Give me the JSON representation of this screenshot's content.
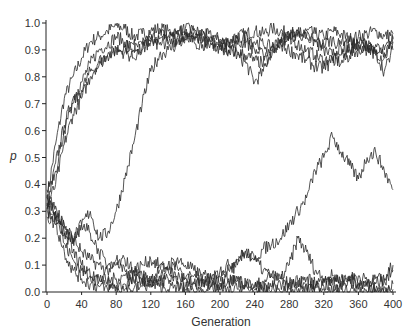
{
  "chart_data": {
    "type": "line",
    "title": "",
    "xlabel": "Generation",
    "ylabel": "p",
    "xlim": [
      0,
      400
    ],
    "ylim": [
      0.0,
      1.0
    ],
    "xticks": [
      0,
      40,
      80,
      120,
      160,
      200,
      240,
      280,
      320,
      360,
      400
    ],
    "yticks": [
      "0.0",
      "0.1",
      "0.2",
      "0.3",
      "0.4",
      "0.5",
      "0.6",
      "0.7",
      "0.8",
      "0.9",
      "1.0"
    ],
    "grid": false,
    "legend": null,
    "line_color": "#2a2a2a",
    "x": [
      0,
      10,
      20,
      30,
      40,
      50,
      60,
      70,
      80,
      90,
      100,
      110,
      120,
      130,
      140,
      150,
      160,
      170,
      180,
      190,
      200,
      210,
      220,
      230,
      240,
      250,
      260,
      270,
      280,
      290,
      300,
      310,
      320,
      330,
      340,
      350,
      360,
      370,
      380,
      390,
      400
    ],
    "series": [
      {
        "name": "run-1",
        "values": [
          0.35,
          0.55,
          0.72,
          0.8,
          0.87,
          0.93,
          0.95,
          0.97,
          0.99,
          0.98,
          0.95,
          0.96,
          0.97,
          0.98,
          0.97,
          0.96,
          0.98,
          0.97,
          0.96,
          0.95,
          0.94,
          0.93,
          0.95,
          0.96,
          0.97,
          0.96,
          0.98,
          0.97,
          0.96,
          0.95,
          0.97,
          0.96,
          0.95,
          0.97,
          0.96,
          0.94,
          0.95,
          0.96,
          0.97,
          0.95,
          0.96
        ]
      },
      {
        "name": "run-2",
        "values": [
          0.3,
          0.48,
          0.62,
          0.72,
          0.78,
          0.85,
          0.9,
          0.92,
          0.95,
          0.93,
          0.9,
          0.92,
          0.94,
          0.96,
          0.95,
          0.97,
          0.96,
          0.98,
          0.97,
          0.95,
          0.93,
          0.9,
          0.88,
          0.85,
          0.78,
          0.82,
          0.9,
          0.93,
          0.95,
          0.92,
          0.9,
          0.88,
          0.86,
          0.87,
          0.85,
          0.88,
          0.9,
          0.92,
          0.89,
          0.87,
          0.93
        ]
      },
      {
        "name": "run-3",
        "values": [
          0.32,
          0.4,
          0.55,
          0.66,
          0.72,
          0.8,
          0.86,
          0.88,
          0.9,
          0.91,
          0.92,
          0.9,
          0.93,
          0.94,
          0.92,
          0.94,
          0.95,
          0.93,
          0.92,
          0.93,
          0.91,
          0.9,
          0.92,
          0.93,
          0.9,
          0.88,
          0.91,
          0.93,
          0.94,
          0.96,
          0.95,
          0.93,
          0.92,
          0.94,
          0.91,
          0.9,
          0.93,
          0.92,
          0.88,
          0.9,
          0.94
        ]
      },
      {
        "name": "run-4",
        "values": [
          0.38,
          0.45,
          0.6,
          0.7,
          0.75,
          0.82,
          0.84,
          0.88,
          0.9,
          0.89,
          0.87,
          0.91,
          0.93,
          0.92,
          0.95,
          0.94,
          0.96,
          0.95,
          0.93,
          0.92,
          0.91,
          0.93,
          0.94,
          0.95,
          0.93,
          0.92,
          0.91,
          0.94,
          0.96,
          0.97,
          0.95,
          0.93,
          0.9,
          0.88,
          0.92,
          0.93,
          0.91,
          0.9,
          0.92,
          0.89,
          0.95
        ]
      },
      {
        "name": "run-5",
        "values": [
          0.33,
          0.3,
          0.22,
          0.2,
          0.25,
          0.3,
          0.2,
          0.22,
          0.3,
          0.42,
          0.55,
          0.7,
          0.82,
          0.88,
          0.9,
          0.92,
          0.94,
          0.95,
          0.93,
          0.92,
          0.9,
          0.91,
          0.89,
          0.88,
          0.86,
          0.85,
          0.88,
          0.92,
          0.9,
          0.88,
          0.86,
          0.84,
          0.83,
          0.86,
          0.88,
          0.9,
          0.92,
          0.91,
          0.89,
          0.82,
          0.9
        ]
      },
      {
        "name": "run-6",
        "values": [
          0.3,
          0.28,
          0.25,
          0.2,
          0.15,
          0.12,
          0.1,
          0.08,
          0.1,
          0.12,
          0.08,
          0.06,
          0.05,
          0.08,
          0.1,
          0.12,
          0.1,
          0.08,
          0.06,
          0.05,
          0.08,
          0.1,
          0.12,
          0.15,
          0.12,
          0.16,
          0.18,
          0.2,
          0.25,
          0.3,
          0.35,
          0.45,
          0.5,
          0.58,
          0.52,
          0.47,
          0.42,
          0.5,
          0.52,
          0.45,
          0.38
        ]
      },
      {
        "name": "run-7",
        "values": [
          0.35,
          0.3,
          0.18,
          0.12,
          0.08,
          0.06,
          0.05,
          0.04,
          0.05,
          0.06,
          0.08,
          0.1,
          0.12,
          0.1,
          0.08,
          0.06,
          0.05,
          0.06,
          0.04,
          0.05,
          0.06,
          0.08,
          0.1,
          0.15,
          0.12,
          0.08,
          0.06,
          0.05,
          0.1,
          0.2,
          0.15,
          0.08,
          0.05,
          0.06,
          0.04,
          0.05,
          0.06,
          0.04,
          0.03,
          0.05,
          0.1
        ]
      },
      {
        "name": "run-8",
        "values": [
          0.28,
          0.25,
          0.15,
          0.08,
          0.05,
          0.03,
          0.02,
          0.01,
          0.02,
          0.03,
          0.04,
          0.05,
          0.03,
          0.04,
          0.05,
          0.03,
          0.02,
          0.03,
          0.04,
          0.05,
          0.03,
          0.04,
          0.05,
          0.03,
          0.02,
          0.04,
          0.06,
          0.05,
          0.03,
          0.04,
          0.05,
          0.03,
          0.02,
          0.04,
          0.05,
          0.06,
          0.03,
          0.04,
          0.05,
          0.04,
          0.08
        ]
      },
      {
        "name": "run-9",
        "values": [
          0.36,
          0.32,
          0.24,
          0.18,
          0.25,
          0.22,
          0.15,
          0.1,
          0.12,
          0.08,
          0.05,
          0.03,
          0.04,
          0.06,
          0.08,
          0.1,
          0.05,
          0.03,
          0.04,
          0.02,
          0.03,
          0.05,
          0.04,
          0.03,
          0.02,
          0.01,
          0.02,
          0.03,
          0.02,
          0.04,
          0.03,
          0.02,
          0.05,
          0.03,
          0.02,
          0.04,
          0.03,
          0.02,
          0.01,
          0.02,
          0.03
        ]
      },
      {
        "name": "run-10",
        "values": [
          0.31,
          0.27,
          0.22,
          0.15,
          0.1,
          0.06,
          0.04,
          0.03,
          0.02,
          0.01,
          0.01,
          0.02,
          0.03,
          0.02,
          0.01,
          0.02,
          0.01,
          0.0,
          0.01,
          0.02,
          0.01,
          0.0,
          0.01,
          0.02,
          0.01,
          0.0,
          0.01,
          0.0,
          0.01,
          0.0,
          0.01,
          0.02,
          0.01,
          0.0,
          0.01,
          0.0,
          0.01,
          0.0,
          0.01,
          0.0,
          0.01
        ]
      }
    ]
  }
}
